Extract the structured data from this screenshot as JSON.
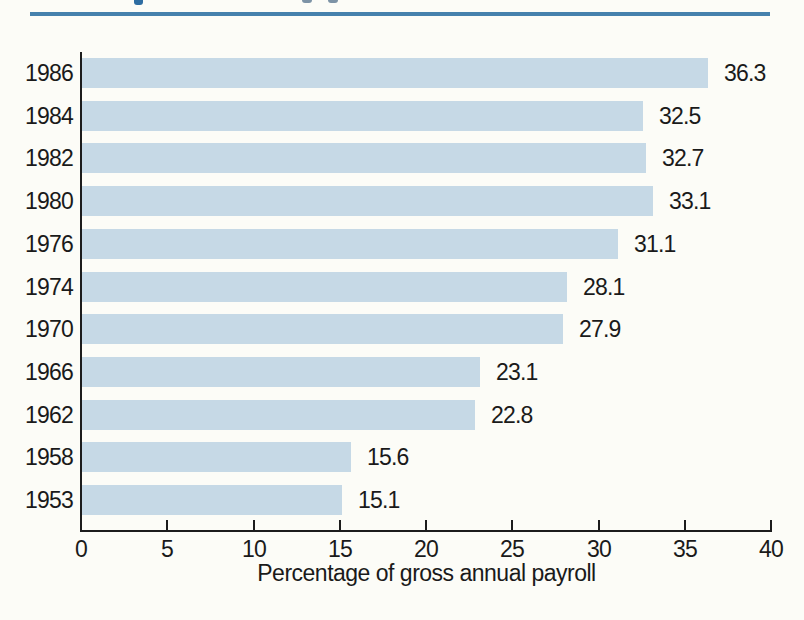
{
  "page": {
    "background_color": "#fcfcf7",
    "divider_rule_color": "#4681ad"
  },
  "chart_data": {
    "type": "bar",
    "orientation": "horizontal",
    "title": "",
    "categories": [
      "1986",
      "1984",
      "1982",
      "1980",
      "1976",
      "1974",
      "1970",
      "1966",
      "1962",
      "1958",
      "1953"
    ],
    "values": [
      36.3,
      32.5,
      32.7,
      33.1,
      31.1,
      28.1,
      27.9,
      23.1,
      22.8,
      15.6,
      15.1
    ],
    "value_labels": [
      "36.3",
      "32.5",
      "32.7",
      "33.1",
      "31.1",
      "28.1",
      "27.9",
      "23.1",
      "22.8",
      "15.6",
      "15.1"
    ],
    "xlabel": "Percentage of gross annual payroll",
    "ylabel": "",
    "xlim": [
      0,
      40
    ],
    "x_ticks": [
      0,
      5,
      10,
      15,
      20,
      25,
      30,
      35,
      40
    ],
    "grid": false,
    "legend": false,
    "value_labels_shown": true,
    "bar_color": "#c6d9e6",
    "axis_color": "#1c1c1c",
    "text_color": "#1a1a1a"
  }
}
